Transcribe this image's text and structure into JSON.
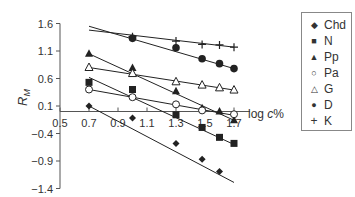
{
  "chart_data": {
    "type": "scatter",
    "title": "",
    "xlabel": "log c%",
    "ylabel": "RM",
    "xlim": [
      0.5,
      1.7
    ],
    "ylim": [
      -1.4,
      1.6
    ],
    "x_ticks": [
      0.5,
      0.7,
      0.9,
      1.1,
      1.3,
      1.5,
      1.7
    ],
    "x_tick_labels": [
      "0.5",
      "0.7",
      "0.9",
      "1.1",
      "1.3",
      "1.5",
      "1.7"
    ],
    "y_ticks": [
      1.6,
      1.1,
      0.6,
      0.1,
      -0.4,
      -0.9,
      -1.4
    ],
    "y_tick_labels": [
      "1.6",
      "1.1",
      "0.6",
      "0.1",
      "−0.4",
      "−0.9",
      "−1.4"
    ],
    "grid": false,
    "legend_position": "right",
    "trendlines": true,
    "series": [
      {
        "name": "Chd",
        "marker": "diamond-filled",
        "x": [
          0.7,
          1.0,
          1.3,
          1.48,
          1.6
        ],
        "y": [
          0.1,
          -0.12,
          -0.58,
          -0.87,
          -1.09
        ],
        "line": {
          "x0": 0.7,
          "y0": 0.1,
          "x1": 1.7,
          "y1": -1.29
        }
      },
      {
        "name": "N",
        "marker": "square-filled",
        "x": [
          0.7,
          1.0,
          1.3,
          1.48,
          1.6,
          1.7
        ],
        "y": [
          0.53,
          0.4,
          -0.06,
          -0.29,
          -0.47,
          -0.58
        ],
        "line": {
          "x0": 0.7,
          "y0": 0.62,
          "x1": 1.7,
          "y1": -0.6
        }
      },
      {
        "name": "Pp",
        "marker": "triangle-filled",
        "x": [
          0.7,
          1.0,
          1.3,
          1.48,
          1.6,
          1.7
        ],
        "y": [
          1.05,
          0.79,
          0.37,
          0.06,
          0.0,
          -0.16
        ],
        "line": {
          "x0": 0.7,
          "y0": 1.05,
          "x1": 1.7,
          "y1": -0.16
        }
      },
      {
        "name": "Pa",
        "marker": "circle-open",
        "x": [
          0.7,
          1.0,
          1.3,
          1.48,
          1.7
        ],
        "y": [
          0.4,
          0.26,
          0.13,
          0.02,
          -0.05
        ],
        "line": {
          "x0": 0.7,
          "y0": 0.4,
          "x1": 1.7,
          "y1": -0.07
        }
      },
      {
        "name": "G",
        "marker": "triangle-open",
        "x": [
          0.7,
          1.0,
          1.3,
          1.48,
          1.6,
          1.7
        ],
        "y": [
          0.8,
          0.69,
          0.54,
          0.48,
          0.43,
          0.39
        ],
        "line": {
          "x0": 0.7,
          "y0": 0.8,
          "x1": 1.7,
          "y1": 0.39
        }
      },
      {
        "name": "D",
        "marker": "circle-filled",
        "x": [
          1.0,
          1.3,
          1.48,
          1.6,
          1.7
        ],
        "y": [
          1.33,
          1.16,
          0.96,
          0.87,
          0.78
        ],
        "line": {
          "x0": 0.7,
          "y0": 1.55,
          "x1": 1.7,
          "y1": 0.78
        }
      },
      {
        "name": "K",
        "marker": "plus",
        "x": [
          1.0,
          1.3,
          1.48,
          1.6,
          1.7
        ],
        "y": [
          1.36,
          1.28,
          1.22,
          1.21,
          1.17
        ],
        "line": {
          "x0": 0.7,
          "y0": 1.48,
          "x1": 1.7,
          "y1": 1.17
        }
      }
    ]
  },
  "legend": {
    "items": [
      {
        "symbol": "◆",
        "label": "Chd"
      },
      {
        "symbol": "■",
        "label": "N"
      },
      {
        "symbol": "▲",
        "label": "Pp"
      },
      {
        "symbol": "○",
        "label": "Pa"
      },
      {
        "symbol": "△",
        "label": "G"
      },
      {
        "symbol": "●",
        "label": "D"
      },
      {
        "symbol": "+",
        "label": "K"
      }
    ]
  },
  "axes": {
    "ylabel_main": "R",
    "ylabel_sub": "M",
    "xlabel_pre": "log ",
    "xlabel_italic": "c",
    "xlabel_post": "%"
  }
}
